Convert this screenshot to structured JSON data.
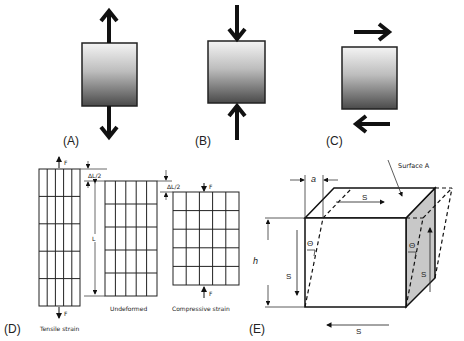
{
  "panels": {
    "A": {
      "label": "(A)",
      "type": "tension"
    },
    "B": {
      "label": "(B)",
      "type": "compression"
    },
    "C": {
      "label": "(C)",
      "type": "shear"
    },
    "D": {
      "label": "(D)",
      "force_label": "F",
      "delta_label": "ΔL/2",
      "length_label": "L",
      "captions": {
        "tensile": "Tensile strain",
        "undeformed": "Undeformed",
        "compressive": "Compressive strain"
      }
    },
    "E": {
      "label": "(E)",
      "surface_label": "Surface A",
      "a_label": "a",
      "h_label": "h",
      "s_label": "S",
      "theta_label": "Θ"
    }
  },
  "colors": {
    "gradient_top": "#f2f2f2",
    "gradient_bottom": "#4a4a4a",
    "stroke": "#111111",
    "side_face": "#c8c8c8"
  }
}
